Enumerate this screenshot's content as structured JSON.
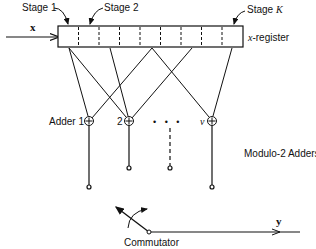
{
  "diagram": {
    "input_label": "x",
    "output_label": "y",
    "register_label": "x-register",
    "register_label_italic_part": "x",
    "register_label_rest": "-register",
    "stage_labels": [
      "Stage 1",
      "Stage 2",
      "Stage K"
    ],
    "stage_k_prefix": "Stage ",
    "stage_k_symbol": "K",
    "adder_labels": [
      "Adder 1",
      "2",
      "v"
    ],
    "adders_caption": "Modulo-2 Adders",
    "commutator_label": "Commutator",
    "register_cells": 9,
    "ellipsis": "• • •"
  }
}
